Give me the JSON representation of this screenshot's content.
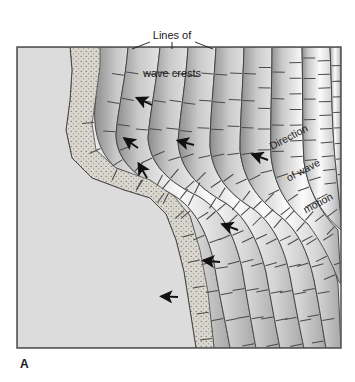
{
  "figure": {
    "panel_letter": "A",
    "labels": {
      "crest_line1": "Lines of",
      "crest_line2": "wave crests",
      "direction_line1": "Direction",
      "direction_line2": "of wave",
      "direction_line3": "motion"
    }
  },
  "colors": {
    "land": "#dcdcdc",
    "sand": "#d8d4cc",
    "stipple": "#6b6b6b",
    "water_light": "#f2f2f2",
    "water_dark": "#8a8a8a",
    "outline": "#3a3a3a",
    "frame": "#5a5a5a",
    "arrow": "#111111",
    "ray": "#4a4a4a",
    "text": "#1a1a1a",
    "page": "#ffffff"
  },
  "frame": {
    "x": 17,
    "y": 47,
    "width": 324,
    "height": 301
  },
  "diagram": {
    "type": "wave-refraction-map",
    "leader_lines": [
      {
        "x1": 150,
        "y1": 42,
        "x2": 132,
        "y2": 49
      },
      {
        "x1": 172,
        "y1": 42,
        "x2": 172,
        "y2": 49
      },
      {
        "x1": 195,
        "y1": 42,
        "x2": 213,
        "y2": 49
      }
    ],
    "shoreline_points": "17,47 70,47 72,70 70,100 66,130 72,158 92,178 124,190 150,198 166,214 176,240 184,272 190,310 196,348 17,348",
    "beach_points": "70,47 100,47 100,66 96,96 92,124 96,150 116,168 150,180 174,196 190,216 200,250 208,292 214,348 196,348 190,310 184,272 176,240 166,214 150,198 124,190 92,178 72,158 66,130 70,100 72,70",
    "crest_bands": [
      {
        "id": 1,
        "path": "M100,47 L128,47 C126,78 118,108 116,134 C116,160 136,178 168,192 C192,204 206,228 214,262 C220,300 226,324 230,348 L214,348 C208,292 200,250 190,216 C174,196 150,180 116,168 C96,150 92,124 96,96 C100,66 100,47 Z"
      },
      {
        "id": 2,
        "path": "M128,47 L160,47 C157,80 150,112 148,138 C150,164 168,182 198,196 C222,210 234,234 242,268 C248,304 252,326 256,348 L230,348 C226,324 220,300 214,262 C206,228 192,204 168,192 C136,178 116,160 116,134 C118,108 126,78 128,47 Z"
      },
      {
        "id": 3,
        "path": "M160,47 L188,47 C186,82 180,114 178,142 C180,168 196,186 224,202 C246,216 258,240 266,272 C272,306 276,328 280,348 L256,348 C252,326 248,304 242,268 C234,234 222,210 198,196 C168,182 150,164 148,138 C150,112 157,80 160,47 Z"
      },
      {
        "id": 4,
        "path": "M188,47 L216,47 C214,84 210,118 210,146 C212,172 226,192 252,208 C272,222 284,246 290,276 C296,308 300,330 304,348 L280,348 C276,328 272,306 266,272 C258,240 246,216 224,202 C196,186 180,168 178,142 C180,114 186,82 188,47 Z"
      },
      {
        "id": 5,
        "path": "M216,47 L244,47 C243,86 240,122 240,150 C243,178 256,198 280,216 C298,230 308,252 314,280 C320,310 323,332 326,348 L304,348 C300,330 296,308 290,276 C284,246 272,222 252,208 C226,192 212,172 210,146 C210,118 214,84 216,47 Z"
      },
      {
        "id": 6,
        "path": "M244,47 L272,47 C272,88 270,126 271,156 C274,184 286,206 308,224 C324,238 333,258 338,284 L341,348 L326,348 C323,332 320,310 314,280 C308,252 298,230 280,216 C256,198 243,178 240,150 C240,122 243,86 244,47 Z"
      },
      {
        "id": 7,
        "path": "M272,47 L302,47 C303,90 302,130 304,162 C308,190 320,212 338,230 L341,284 C338,284 333,258 308,224 C286,206 274,184 271,156 C270,126 272,88 272,47 Z"
      },
      {
        "id": 8,
        "path": "M302,47 L330,47 C332,92 332,134 336,168 C338,190 340,206 341,218 L341,230 C320,212 308,190 304,162 C302,130 303,90 302,47 Z"
      },
      {
        "id": 9,
        "path": "M330,47 L341,47 L341,218 C340,206 338,190 336,168 C332,134 332,92 330,47 Z"
      }
    ],
    "arrows": [
      {
        "x": 152,
        "y": 105,
        "angle": 205
      },
      {
        "x": 138,
        "y": 148,
        "angle": 215
      },
      {
        "x": 147,
        "y": 178,
        "angle": 240
      },
      {
        "x": 194,
        "y": 145,
        "angle": 195
      },
      {
        "x": 238,
        "y": 230,
        "angle": 200
      },
      {
        "x": 220,
        "y": 262,
        "angle": 185
      },
      {
        "x": 178,
        "y": 297,
        "angle": 182
      },
      {
        "x": 268,
        "y": 160,
        "angle": 200
      }
    ],
    "ray_count": 96
  }
}
